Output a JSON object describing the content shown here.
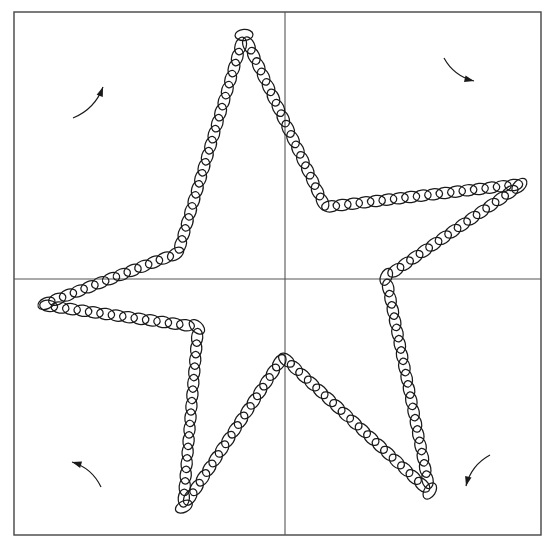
{
  "figure": {
    "title": "",
    "type": "ellipse-chain-star-diagram",
    "background_color": "#ffffff",
    "stroke_color": "#1a1a1a",
    "axis_color": "#555555",
    "border_color": "#444444",
    "canvas": {
      "width": 558,
      "height": 546
    },
    "plot_frame": {
      "name": "outer-border",
      "x": 14,
      "y": 12,
      "width": 527,
      "height": 523,
      "stroke_width": 1.4
    },
    "axes": {
      "vertical_line": {
        "x": 285,
        "y1": 12,
        "y2": 535
      },
      "horizontal_line": {
        "y": 279,
        "x1": 14,
        "x2": 541
      },
      "stroke_width": 1.1
    },
    "glyph": {
      "shape": "ellipse",
      "semi_major_axis": 9.0,
      "semi_minor_axis": 5.6,
      "stroke_width": 1.25,
      "fill": "none",
      "orientation": "tangent-to-path",
      "spacing": 11.5,
      "count": 142
    },
    "arrows": [
      {
        "name": "arrow-top-left",
        "label": "",
        "tail": {
          "x": 73,
          "y": 118
        },
        "head": {
          "x": 103,
          "y": 87
        },
        "curvature": -0.22,
        "direction": "up-right"
      },
      {
        "name": "arrow-top-right",
        "label": "",
        "tail": {
          "x": 444,
          "y": 58
        },
        "head": {
          "x": 474,
          "y": 81
        },
        "curvature": -0.22,
        "direction": "down-right"
      },
      {
        "name": "arrow-bottom-left",
        "label": "",
        "tail": {
          "x": 101,
          "y": 487
        },
        "head": {
          "x": 72,
          "y": 462
        },
        "curvature": -0.22,
        "direction": "up-left"
      },
      {
        "name": "arrow-bottom-right",
        "label": "",
        "tail": {
          "x": 490,
          "y": 455
        },
        "head": {
          "x": 466,
          "y": 486
        },
        "curvature": -0.22,
        "direction": "down-left"
      }
    ],
    "star_path": {
      "closed": true,
      "description": "five-pointed star traced counterclockwise",
      "vertices": [
        {
          "name": "tip-top",
          "kind": "outer",
          "x": 244,
          "y": 35
        },
        {
          "name": "notch-upper-right",
          "kind": "inner",
          "x": 325,
          "y": 207
        },
        {
          "name": "tip-right",
          "kind": "outer",
          "x": 522,
          "y": 184
        },
        {
          "name": "notch-lower-right",
          "kind": "inner",
          "x": 386,
          "y": 277
        },
        {
          "name": "tip-bottom-right",
          "kind": "outer",
          "x": 430,
          "y": 492
        },
        {
          "name": "notch-bottom",
          "kind": "inner",
          "x": 283,
          "y": 357
        },
        {
          "name": "tip-bottom-left",
          "kind": "outer",
          "x": 183,
          "y": 508
        },
        {
          "name": "notch-lower-left",
          "kind": "inner",
          "x": 198,
          "y": 327
        },
        {
          "name": "tip-left",
          "kind": "outer",
          "x": 42,
          "y": 305
        },
        {
          "name": "notch-upper-left",
          "kind": "inner",
          "x": 178,
          "y": 253
        }
      ]
    }
  },
  "chart_data": {
    "type": "scatter",
    "title": "",
    "xlabel": "",
    "ylabel": "",
    "xlim": [
      14,
      541
    ],
    "ylim": [
      12,
      535
    ],
    "grid": false,
    "legend": null,
    "series": [
      {
        "name": "star-outline-ellipse-chain",
        "marker": "ellipse",
        "x": [
          244,
          522,
          430,
          183,
          42
        ],
        "y": [
          35,
          184,
          492,
          508,
          305
        ],
        "note": "outer star tip coordinates in pixel space"
      },
      {
        "name": "star-inner-notches",
        "marker": "ellipse",
        "x": [
          325,
          386,
          283,
          198,
          178
        ],
        "y": [
          207,
          277,
          357,
          327,
          253
        ],
        "note": "inner star notch coordinates in pixel space"
      }
    ],
    "annotations": [
      {
        "text": "",
        "kind": "curved-arrow",
        "x": 88,
        "y": 102
      },
      {
        "text": "",
        "kind": "curved-arrow",
        "x": 459,
        "y": 69
      },
      {
        "text": "",
        "kind": "curved-arrow",
        "x": 86,
        "y": 474
      },
      {
        "text": "",
        "kind": "curved-arrow",
        "x": 478,
        "y": 470
      }
    ]
  }
}
